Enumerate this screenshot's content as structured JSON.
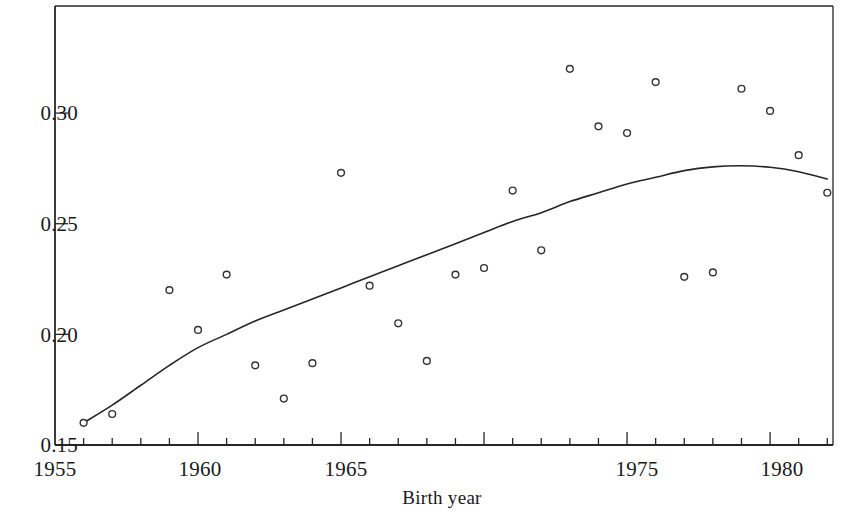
{
  "figure": {
    "background_color": "#ffffff",
    "ink_color": "#262626"
  },
  "axes": {
    "x_title": "Birth year",
    "y_title": "",
    "x_tick_labels": [
      "1955",
      "1960",
      "1965",
      "1975",
      "1980"
    ],
    "y_tick_labels": [
      "0.30",
      "0.25",
      "0.20",
      "0.15"
    ]
  },
  "chart_data": {
    "type": "scatter",
    "title": "",
    "xlabel": "Birth year",
    "ylabel": "",
    "xlim": [
      1955,
      1982.2
    ],
    "ylim": [
      0.15,
      0.3484
    ],
    "grid": false,
    "legend": "none",
    "x_major_ticks": [
      1955,
      1960,
      1965,
      1970,
      1975,
      1980
    ],
    "x_major_tick_labels_shown": [
      "1955",
      "1960",
      "1965",
      "1975",
      "1980"
    ],
    "x_minor_tick_interval": 1,
    "y_ticks": [
      0.15,
      0.2,
      0.25,
      0.3
    ],
    "y_tick_labels": [
      "0.15",
      "0.20",
      "0.25",
      "0.30"
    ],
    "marker": "open-circle",
    "series": [
      {
        "name": "observed",
        "type": "scatter",
        "x": [
          1956,
          1957,
          1959,
          1960,
          1961,
          1962,
          1963,
          1964,
          1965,
          1966,
          1967,
          1968,
          1969,
          1970,
          1971,
          1972,
          1973,
          1974,
          1975,
          1976,
          1977,
          1978,
          1979,
          1980,
          1981,
          1982
        ],
        "values": [
          0.16,
          0.164,
          0.22,
          0.202,
          0.227,
          0.186,
          0.171,
          0.187,
          0.273,
          0.222,
          0.205,
          0.188,
          0.227,
          0.23,
          0.265,
          0.238,
          0.32,
          0.294,
          0.291,
          0.314,
          0.226,
          0.228,
          0.311,
          0.301,
          0.281,
          0.264
        ]
      },
      {
        "name": "fitted-curve",
        "type": "line",
        "x": [
          1956,
          1957,
          1958,
          1959,
          1960,
          1961,
          1962,
          1963,
          1964,
          1965,
          1966,
          1967,
          1968,
          1969,
          1970,
          1971,
          1972,
          1973,
          1974,
          1975,
          1976,
          1977,
          1978,
          1979,
          1980,
          1981,
          1982
        ],
        "values": [
          0.16,
          0.168,
          0.177,
          0.186,
          0.194,
          0.2,
          0.206,
          0.211,
          0.216,
          0.221,
          0.226,
          0.231,
          0.236,
          0.241,
          0.246,
          0.251,
          0.255,
          0.26,
          0.264,
          0.268,
          0.271,
          0.274,
          0.2757,
          0.2762,
          0.2755,
          0.2735,
          0.2702
        ]
      }
    ]
  }
}
